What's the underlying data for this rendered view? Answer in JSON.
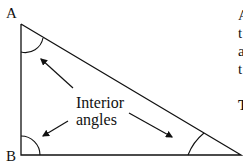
{
  "diagram": {
    "vertices": {
      "A": "A",
      "B": "B"
    },
    "caption": [
      "Interior",
      "angles"
    ],
    "side_text": [
      "A",
      "t",
      "a",
      "t"
    ],
    "side_bold": "T",
    "colors": {
      "stroke": "#111111",
      "background": "#ffffff"
    }
  }
}
